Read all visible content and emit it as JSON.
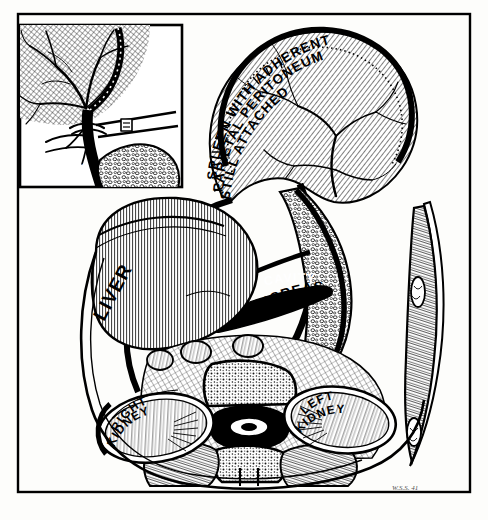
{
  "figure": {
    "medium": "pen-and-ink line drawing",
    "frame_color": "#000000",
    "background_color": "#fdfdfb",
    "ink_color": "#000000"
  },
  "inset": {
    "name": "splenic-hilum-detail",
    "position": "top-left",
    "label": "L.C.",
    "label_style": "white italic serif on black vessel band",
    "description": "Detail of splenic vessels at hilum with ligature tied around pedicle"
  },
  "labels": {
    "spleen": {
      "lines": [
        "SPLEEN WITH ADHERENT",
        "PARIETAL PERITONEUM",
        "STILL ATTACHED"
      ],
      "full_text": "SPLEEN WITH ADHERENT PARIETAL PERITONEUM STILL ATTACHED",
      "color": "#000000",
      "style": "curved uppercase, three arced lines"
    },
    "stomach": {
      "text": "STOMACH",
      "color": "#000000",
      "style": "curved uppercase"
    },
    "lesser_cavity": {
      "text": "LESSER CAVITY",
      "color": "#ffffff",
      "style": "white uppercase on solid black band"
    },
    "pancreas": {
      "text": "PANCREAS",
      "color": "#000000",
      "style": "curved uppercase"
    },
    "liver": {
      "text": "LIVER",
      "color": "#000000",
      "style": "rotated uppercase"
    },
    "right_kidney": {
      "lines": [
        "RIGHT",
        "KIDNEY"
      ],
      "full_text": "RIGHT KIDNEY",
      "color": "#000000",
      "style": "curved uppercase, two arced lines"
    },
    "left_kidney": {
      "lines": [
        "LEFT",
        "KIDNEY"
      ],
      "full_text": "LEFT KIDNEY",
      "color": "#000000",
      "style": "curved uppercase, two arced lines"
    }
  },
  "signature": {
    "text": "W.S.S. 41",
    "position": "bottom-right",
    "color": "#555555"
  },
  "structures": [
    "spleen",
    "stomach",
    "lesser cavity",
    "pancreas",
    "liver",
    "right kidney",
    "left kidney",
    "vertebral body",
    "spinal canal",
    "aorta",
    "abdominal wall"
  ]
}
